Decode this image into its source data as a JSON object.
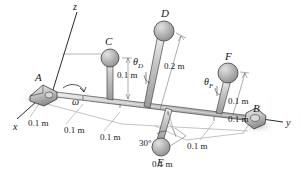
{
  "figure": {
    "background": "#ffffff",
    "ink_color": "#15181c",
    "sphere_fill": "#b9b9b9",
    "sphere_edge": "#4b4b4b",
    "shaft_fill": "#c9c9c9",
    "shadow_color": "#d6d6d6"
  },
  "axes": [
    {
      "name": "x",
      "label": "x",
      "x": 13,
      "y": 122
    },
    {
      "name": "y",
      "label": "y",
      "x": 286,
      "y": 124
    },
    {
      "name": "z",
      "label": "z",
      "x": 73,
      "y": 3
    }
  ],
  "bearings": [
    {
      "name": "A",
      "label": "A",
      "x": 35,
      "y": 72
    },
    {
      "name": "B",
      "label": "B",
      "x": 253,
      "y": 110
    }
  ],
  "spheres": [
    {
      "name": "C",
      "label": "C",
      "label_x": 105,
      "label_y": 37,
      "cx": 110,
      "cy": 58,
      "r": 9
    },
    {
      "name": "D",
      "label": "D",
      "label_x": 160,
      "label_y": 9,
      "cx": 164,
      "cy": 31,
      "r": 10
    },
    {
      "name": "E",
      "label": "E",
      "label_x": 157,
      "label_y": 158,
      "cx": 161,
      "cy": 147,
      "r": 9
    },
    {
      "name": "F",
      "label": "F",
      "label_x": 225,
      "label_y": 53,
      "cx": 228,
      "cy": 73,
      "r": 10
    }
  ],
  "angle_labels": [
    {
      "name": "theta-D",
      "symbol": "θ",
      "subscript": "D",
      "x": 134,
      "y": 61
    },
    {
      "name": "theta-F",
      "symbol": "θ",
      "subscript": "F",
      "x": 205,
      "y": 81
    },
    {
      "name": "omega",
      "symbol": "ω",
      "subscript": "",
      "x": 74,
      "y": 101
    }
  ],
  "angle_value": {
    "name": "angle-30",
    "label": "30°",
    "x": 141,
    "y": 143
  },
  "dimensions": [
    {
      "name": "dim-C-height",
      "label": "0.1 m",
      "x": 118,
      "y": 73
    },
    {
      "name": "dim-D-length",
      "label": "0.2 m",
      "x": 167,
      "y": 65
    },
    {
      "name": "dim-F-height",
      "label": "0.1 m",
      "x": 232,
      "y": 99
    },
    {
      "name": "dim-A-to-C",
      "label": "0.1 m",
      "x": 30,
      "y": 122
    },
    {
      "name": "dim-C-to-D",
      "label": "0.1 m",
      "x": 66,
      "y": 128
    },
    {
      "name": "dim-D-to-E",
      "label": "0.1 m",
      "x": 103,
      "y": 135
    },
    {
      "name": "dim-E-length",
      "label": "0.1 m",
      "x": 155,
      "y": 163
    },
    {
      "name": "dim-E-to-F",
      "label": "0.1 m",
      "x": 190,
      "y": 145
    },
    {
      "name": "dim-F-to-B",
      "label": "0.1 m",
      "x": 232,
      "y": 118
    }
  ]
}
